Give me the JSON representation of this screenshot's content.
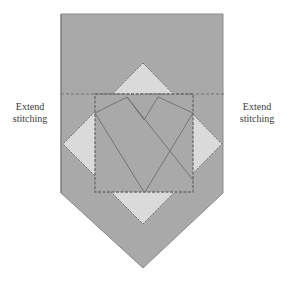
{
  "labels": {
    "left": {
      "line1": "Extend",
      "line2": "stitching"
    },
    "right": {
      "line1": "Extend",
      "line2": "stitching"
    }
  },
  "colors": {
    "pennant_fill": "#a9a9a9",
    "triangle_fill": "#dadada",
    "line": "#6e6e6e",
    "text": "#3a3a3a",
    "background": "#ffffff"
  },
  "shapes": {
    "pennant": "pennant-shaped fabric piece with pointed bottom",
    "inner_square": "square block with dashed stitching border",
    "diamond": "rotated square forming four light corner triangles",
    "stitch_line": "dashed horizontal stitching line across width"
  }
}
